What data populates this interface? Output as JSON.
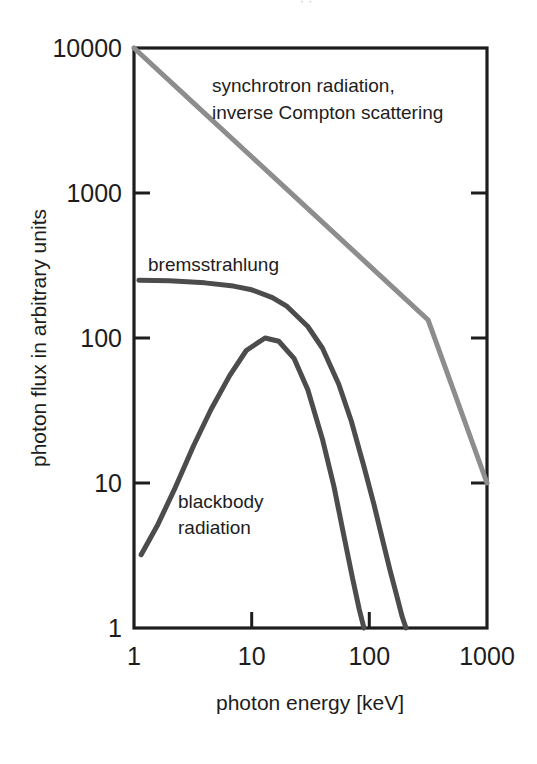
{
  "figure": {
    "background_color": "#ffffff",
    "frame_color": "#1d1d1d",
    "page_bleed_text": "· ·"
  },
  "chart_data": {
    "type": "line",
    "title": "",
    "xlabel": "photon energy [keV]",
    "ylabel": "photon flux in arbitrary units",
    "xscale": "log",
    "yscale": "log",
    "xlim": [
      1,
      1000
    ],
    "ylim": [
      1,
      10000
    ],
    "xticks": [
      1,
      10,
      100,
      1000
    ],
    "xtick_labels": [
      "1",
      "10",
      "100",
      "1000"
    ],
    "yticks": [
      1,
      10,
      100,
      1000,
      10000
    ],
    "ytick_labels": [
      "1",
      "10",
      "100",
      "1000",
      "10000"
    ],
    "grid": false,
    "legend": "inline-annotations",
    "series": [
      {
        "name": "synchrotron radiation, inverse Compton scattering",
        "color": "#8d8d8d",
        "linewidth": 5,
        "label_lines": [
          "synchrotron radiation,",
          "inverse Compton scattering"
        ],
        "x": [
          1,
          3.162,
          10,
          31.62,
          100,
          316.2,
          1000
        ],
        "y": [
          10000,
          4217,
          1778,
          750,
          316,
          133,
          10
        ]
      },
      {
        "name": "bremsstrahlung",
        "color": "#4c4c4c",
        "linewidth": 5,
        "label_lines": [
          "bremsstrahlung"
        ],
        "x": [
          1.1,
          2,
          4,
          7,
          10,
          15,
          20,
          30,
          40,
          55,
          70,
          90,
          110,
          130,
          150,
          170,
          190,
          205
        ],
        "y": [
          250,
          248,
          240,
          228,
          215,
          190,
          165,
          120,
          85,
          48,
          27,
          13,
          7.0,
          4.0,
          2.5,
          1.7,
          1.2,
          1.0
        ]
      },
      {
        "name": "blackbody radiation",
        "color": "#4c4c4c",
        "linewidth": 5,
        "label_lines": [
          "blackbody",
          "radiation"
        ],
        "x": [
          1.15,
          1.6,
          2.2,
          3.2,
          4.5,
          6.5,
          9,
          13,
          17,
          23,
          30,
          40,
          50,
          62,
          72,
          82,
          90
        ],
        "y": [
          3.2,
          5.2,
          9.0,
          18,
          32,
          55,
          82,
          100,
          95,
          72,
          44,
          20,
          9.5,
          4.0,
          2.2,
          1.35,
          1.0
        ]
      }
    ],
    "annotations": [
      {
        "name": "synchrotron-annotation",
        "text_lines": [
          "synchrotron radiation,",
          "inverse Compton scattering"
        ],
        "x_px": 212,
        "y_px": 92
      },
      {
        "name": "bremsstrahlung-annotation",
        "text_lines": [
          "bremsstrahlung"
        ],
        "x_px": 148,
        "y_px": 271
      },
      {
        "name": "blackbody-annotation",
        "text_lines": [
          "blackbody",
          "radiation"
        ],
        "x_px": 178,
        "y_px": 508
      }
    ]
  }
}
